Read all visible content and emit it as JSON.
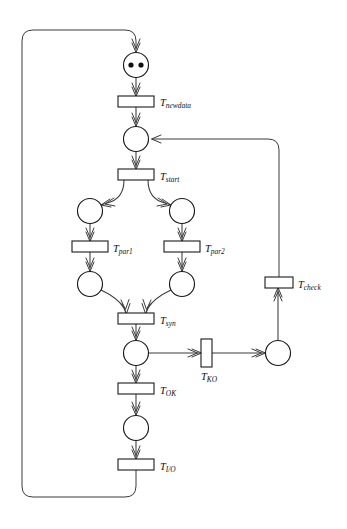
{
  "diagram": {
    "type": "petri-net",
    "background_color": "#ffffff",
    "stroke_color": "#3a3a3a",
    "node_stroke_color": "#1a1a1a",
    "token_color": "#111111"
  },
  "places": [
    {
      "id": "p_start",
      "name": "place-initial",
      "cx": 136,
      "cy": 65,
      "r": 12.5,
      "tokens": 2
    },
    {
      "id": "p_ready",
      "name": "place-ready",
      "cx": 136,
      "cy": 139,
      "r": 12.5,
      "tokens": 0
    },
    {
      "id": "p_par1a",
      "name": "place-par1-in",
      "cx": 90,
      "cy": 211,
      "r": 12.5,
      "tokens": 0
    },
    {
      "id": "p_par2a",
      "name": "place-par2-in",
      "cx": 182,
      "cy": 211,
      "r": 12.5,
      "tokens": 0
    },
    {
      "id": "p_par1b",
      "name": "place-par1-out",
      "cx": 90,
      "cy": 284,
      "r": 12.5,
      "tokens": 0
    },
    {
      "id": "p_par2b",
      "name": "place-par2-out",
      "cx": 182,
      "cy": 284,
      "r": 12.5,
      "tokens": 0
    },
    {
      "id": "p_sync",
      "name": "place-synchronized",
      "cx": 136,
      "cy": 353,
      "r": 12.5,
      "tokens": 0
    },
    {
      "id": "p_done",
      "name": "place-ok",
      "cx": 136,
      "cy": 428,
      "r": 12.5,
      "tokens": 0
    },
    {
      "id": "p_fail",
      "name": "place-failed",
      "cx": 278,
      "cy": 353,
      "r": 12.5,
      "tokens": 0
    }
  ],
  "transitions": [
    {
      "id": "t_newdata",
      "name": "transition-newdata",
      "x": 118,
      "y": 96,
      "width": 36,
      "height": 11,
      "orientation": "horizontal",
      "label_base": "T",
      "label_sub": "newdata",
      "label_x": 160,
      "label_y": 106
    },
    {
      "id": "t_start",
      "name": "transition-start",
      "x": 118,
      "y": 169,
      "width": 36,
      "height": 11,
      "orientation": "horizontal",
      "label_base": "T",
      "label_sub": "start",
      "label_x": 160,
      "label_y": 180
    },
    {
      "id": "t_par1",
      "name": "transition-par1",
      "x": 72,
      "y": 241,
      "width": 36,
      "height": 11,
      "orientation": "horizontal",
      "label_base": "T",
      "label_sub": "par1",
      "label_x": 113,
      "label_y": 252
    },
    {
      "id": "t_par2",
      "name": "transition-par2",
      "x": 164,
      "y": 241,
      "width": 36,
      "height": 11,
      "orientation": "horizontal",
      "label_base": "T",
      "label_sub": "par2",
      "label_x": 205,
      "label_y": 252
    },
    {
      "id": "t_syn",
      "name": "transition-syn",
      "x": 118,
      "y": 313,
      "width": 36,
      "height": 11,
      "orientation": "horizontal",
      "label_base": "T",
      "label_sub": "syn",
      "label_x": 160,
      "label_y": 324
    },
    {
      "id": "t_ok",
      "name": "transition-ok",
      "x": 118,
      "y": 383,
      "width": 36,
      "height": 11,
      "orientation": "horizontal",
      "label_base": "T",
      "label_sub": "OK",
      "label_x": 160,
      "label_y": 394
    },
    {
      "id": "t_io",
      "name": "transition-io",
      "x": 118,
      "y": 459,
      "width": 36,
      "height": 11,
      "orientation": "horizontal",
      "label_base": "T",
      "label_sub": "I/O",
      "label_x": 160,
      "label_y": 470
    },
    {
      "id": "t_ko",
      "name": "transition-ko",
      "x": 201,
      "y": 339,
      "width": 11,
      "height": 28,
      "orientation": "vertical",
      "label_base": "T",
      "label_sub": "KO",
      "label_x": 201,
      "label_y": 380
    },
    {
      "id": "t_check",
      "name": "transition-check",
      "x": 265,
      "y": 277,
      "width": 28,
      "height": 11,
      "orientation": "horizontal",
      "label_base": "T",
      "label_sub": "check",
      "label_x": 298,
      "label_y": 288
    }
  ],
  "arcs": [
    {
      "name": "arc-newdata-to-ready",
      "from": "t_newdata",
      "to": "p_ready"
    },
    {
      "name": "arc-start-token-to-newdata",
      "from": "p_start",
      "to": "t_newdata"
    },
    {
      "name": "arc-ready-to-start",
      "from": "p_ready",
      "to": "t_start"
    },
    {
      "name": "arc-start-to-par1",
      "from": "t_start",
      "to": "p_par1a"
    },
    {
      "name": "arc-start-to-par2",
      "from": "t_start",
      "to": "p_par2a"
    },
    {
      "name": "arc-par1in-to-tpar1",
      "from": "p_par1a",
      "to": "t_par1"
    },
    {
      "name": "arc-par2in-to-tpar2",
      "from": "p_par2a",
      "to": "t_par2"
    },
    {
      "name": "arc-tpar1-to-par1out",
      "from": "t_par1",
      "to": "p_par1b"
    },
    {
      "name": "arc-tpar2-to-par2out",
      "from": "t_par2",
      "to": "p_par2b"
    },
    {
      "name": "arc-par1out-to-syn",
      "from": "p_par1b",
      "to": "t_syn"
    },
    {
      "name": "arc-par2out-to-syn",
      "from": "p_par2b",
      "to": "t_syn"
    },
    {
      "name": "arc-syn-to-sync",
      "from": "t_syn",
      "to": "p_sync"
    },
    {
      "name": "arc-sync-to-ok",
      "from": "p_sync",
      "to": "t_ok"
    },
    {
      "name": "arc-sync-to-ko",
      "from": "p_sync",
      "to": "t_ko"
    },
    {
      "name": "arc-ko-to-failed",
      "from": "t_ko",
      "to": "p_fail"
    },
    {
      "name": "arc-failed-to-check",
      "from": "p_fail",
      "to": "t_check"
    },
    {
      "name": "arc-check-to-ready",
      "from": "t_check",
      "to": "p_ready"
    },
    {
      "name": "arc-ok-to-done",
      "from": "t_ok",
      "to": "p_done"
    },
    {
      "name": "arc-done-to-io",
      "from": "p_done",
      "to": "t_io"
    },
    {
      "name": "arc-io-to-initial",
      "from": "t_io",
      "to": "p_start"
    }
  ]
}
